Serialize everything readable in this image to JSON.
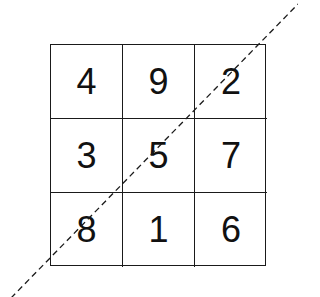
{
  "diagram": {
    "type": "magic-square",
    "rows": [
      [
        "4",
        "9",
        "2"
      ],
      [
        "3",
        "5",
        "7"
      ],
      [
        "8",
        "1",
        "6"
      ]
    ],
    "diagonal": {
      "style": "dashed",
      "direction": "bottom-left to top-right",
      "passes_through": [
        "8",
        "5",
        "2"
      ],
      "color": "#1a1a1a"
    },
    "grid_color": "#1a1a1a",
    "text_color": "#111111"
  }
}
